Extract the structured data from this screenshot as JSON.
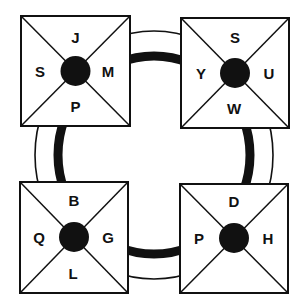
{
  "colors": {
    "ink": "#111111",
    "background": "#ffffff"
  },
  "diagram": {
    "boxes": [
      {
        "position": "top-left",
        "top": "J",
        "left": "S",
        "right": "M",
        "bottom": "P"
      },
      {
        "position": "top-right",
        "top": "S",
        "left": "Y",
        "right": "U",
        "bottom": "W"
      },
      {
        "position": "bottom-left",
        "top": "B",
        "left": "Q",
        "right": "G",
        "bottom": "L"
      },
      {
        "position": "bottom-right",
        "top": "D",
        "left": "P",
        "right": "H",
        "bottom": ""
      }
    ]
  }
}
